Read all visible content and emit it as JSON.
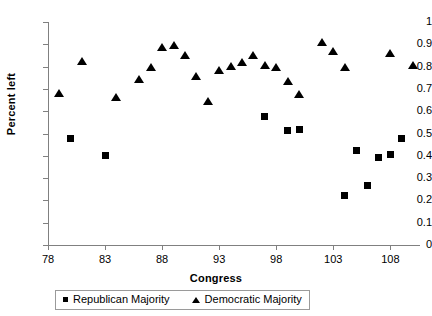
{
  "chart_data": {
    "type": "scatter",
    "title": "",
    "xlabel": "Congress",
    "ylabel": "Percent left",
    "xlim": [
      78,
      110.6
    ],
    "ylim": [
      0,
      1
    ],
    "grid": false,
    "legend_position": "bottom",
    "x_ticks": [
      78,
      83,
      88,
      93,
      98,
      103,
      108
    ],
    "y_ticks": [
      "0",
      "0.1",
      "0.2",
      "0.3",
      "0.4",
      "0.5",
      "0.6",
      "0.7",
      "0.8",
      "0.9",
      "1"
    ],
    "marker_color": "#000000",
    "series": [
      {
        "name": "Republican Majority",
        "marker": "square",
        "points": [
          {
            "x": 80,
            "y": 0.478
          },
          {
            "x": 83,
            "y": 0.4
          },
          {
            "x": 97,
            "y": 0.578
          },
          {
            "x": 99,
            "y": 0.512
          },
          {
            "x": 100,
            "y": 0.518
          },
          {
            "x": 104,
            "y": 0.22
          },
          {
            "x": 105,
            "y": 0.424
          },
          {
            "x": 106,
            "y": 0.265
          },
          {
            "x": 107,
            "y": 0.392
          },
          {
            "x": 108,
            "y": 0.404
          },
          {
            "x": 109,
            "y": 0.478
          }
        ]
      },
      {
        "name": "Democratic Majority",
        "marker": "triangle",
        "points": [
          {
            "x": 79,
            "y": 0.682
          },
          {
            "x": 81,
            "y": 0.826
          },
          {
            "x": 84,
            "y": 0.665
          },
          {
            "x": 86,
            "y": 0.746
          },
          {
            "x": 87,
            "y": 0.798
          },
          {
            "x": 88,
            "y": 0.888
          },
          {
            "x": 89,
            "y": 0.896
          },
          {
            "x": 90,
            "y": 0.85
          },
          {
            "x": 91,
            "y": 0.757
          },
          {
            "x": 92,
            "y": 0.645
          },
          {
            "x": 93,
            "y": 0.783
          },
          {
            "x": 94,
            "y": 0.802
          },
          {
            "x": 95,
            "y": 0.822
          },
          {
            "x": 96,
            "y": 0.85
          },
          {
            "x": 97,
            "y": 0.806
          },
          {
            "x": 98,
            "y": 0.8
          },
          {
            "x": 99,
            "y": 0.734
          },
          {
            "x": 100,
            "y": 0.676
          },
          {
            "x": 102,
            "y": 0.91
          },
          {
            "x": 103,
            "y": 0.868
          },
          {
            "x": 104,
            "y": 0.8
          },
          {
            "x": 108,
            "y": 0.862
          },
          {
            "x": 110,
            "y": 0.806
          }
        ]
      }
    ]
  },
  "legend": {
    "republican_label": "Republican Majority",
    "democratic_label": "Democratic Majority"
  }
}
